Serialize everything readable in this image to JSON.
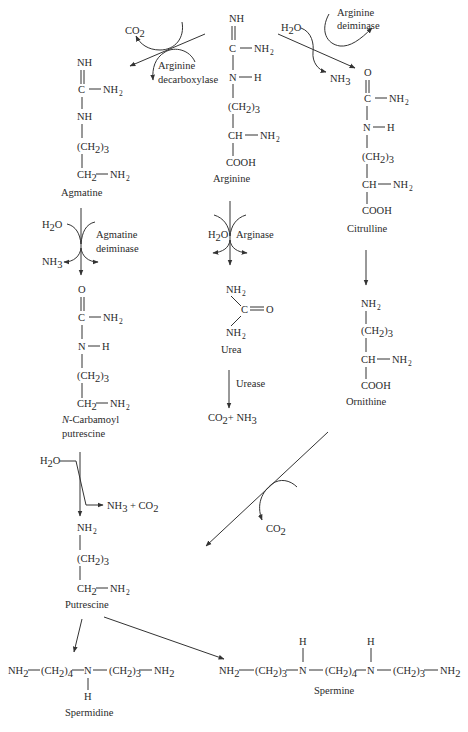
{
  "colors": {
    "ink": "#2a2a2a",
    "line": "#333333",
    "background": "#ffffff"
  },
  "compounds": {
    "arginine": {
      "name": "Arginine",
      "atoms": {
        "nh": "NH",
        "c": "C",
        "nh2": "NH",
        "n": "N",
        "h": "H",
        "ch2": "(CH",
        "ch2_sub": "2",
        "ch2_n": ")",
        "ch2_n_sub": "3",
        "ch": "CH",
        "nh2b": "NH",
        "cooh": "COOH"
      }
    },
    "agmatine": {
      "name": "Agmatine",
      "atoms": {
        "nh": "NH",
        "c": "C",
        "nh2": "NH",
        "nh_chain": "NH",
        "ch2": "(CH",
        "ch2_end": "CH",
        "nh2_end": "NH"
      }
    },
    "citrulline": {
      "name": "Citrulline",
      "atoms": {
        "o": "O",
        "c": "C",
        "nh2": "NH",
        "n": "N",
        "h": "H",
        "ch2": "(CH",
        "ch": "CH",
        "nh2b": "NH",
        "cooh": "COOH"
      }
    },
    "n_carbamoyl_putrescine": {
      "name_italic": "N",
      "name_rest": "-Carbamoyl",
      "name_line2": "putrescine",
      "atoms": {
        "o": "O",
        "c": "C",
        "nh2": "NH",
        "n": "N",
        "h": "H",
        "ch2": "(CH",
        "ch2_end": "CH",
        "nh2_end": "NH"
      }
    },
    "urea": {
      "name": "Urea",
      "atoms": {
        "nh2_top": "NH",
        "c": "C",
        "o": "O",
        "nh2_bottom": "NH"
      }
    },
    "ornithine": {
      "name": "Ornithine",
      "atoms": {
        "nh2": "NH",
        "ch2": "(CH",
        "ch": "CH",
        "nh2b": "NH",
        "cooh": "COOH"
      }
    },
    "putrescine": {
      "name": "Putrescine",
      "atoms": {
        "nh2": "NH",
        "ch2": "(CH",
        "ch2_end": "CH",
        "nh2_end": "NH"
      }
    },
    "spermidine": {
      "name": "Spermidine",
      "formula": {
        "nh2a": "NH",
        "ch2a": "(CH",
        "ch2a_n": "4",
        "n": "N",
        "h": "H",
        "ch2b": "(CH",
        "ch2b_n": "3",
        "nh2b": "NH"
      }
    },
    "spermine": {
      "name": "Spermine",
      "formula": {
        "nh2a": "NH",
        "ch2a": "(CH",
        "ch2a_n": "3",
        "n1": "N",
        "h1": "H",
        "ch2b": "(CH",
        "ch2b_n": "4",
        "n2": "N",
        "h2": "H",
        "ch2c": "(CH",
        "ch2c_n": "3",
        "nh2b": "NH"
      }
    }
  },
  "enzymes": {
    "arginine_decarboxylase": {
      "line1": "Arginine",
      "line2": "decarboxylase"
    },
    "arginine_deiminase": {
      "line1": "Arginine",
      "line2": "deiminase"
    },
    "agmatine_deiminase": {
      "line1": "Agmatine",
      "line2": "deiminase"
    },
    "arginase": {
      "label": "Arginase"
    },
    "urease": {
      "label": "Urease"
    }
  },
  "reagents": {
    "co2_decarboxylase": {
      "base": "CO",
      "sub": "2"
    },
    "h2o_deiminase": {
      "base": "H",
      "sub": "2",
      "rest": "O"
    },
    "nh3_deiminase": {
      "base": "NH",
      "sub": "3"
    },
    "h2o_agmatine": {
      "base": "H",
      "sub": "2",
      "rest": "O"
    },
    "nh3_agmatine": {
      "base": "NH",
      "sub": "3"
    },
    "h2o_arginase": {
      "base": "H",
      "sub": "2",
      "rest": "O"
    },
    "urease_products": {
      "a": "CO",
      "a_sub": "2",
      "plus": "+ NH",
      "b_sub": "3"
    },
    "h2o_carbamoyl": {
      "base": "H",
      "sub": "2",
      "rest": "O"
    },
    "carbamoyl_products": {
      "a": "NH",
      "a_sub": "3",
      "plus": " + CO",
      "b_sub": "2"
    },
    "co2_ornithine": {
      "base": "CO",
      "sub": "2"
    }
  },
  "subscripts": {
    "two": "2",
    "three": "3"
  }
}
